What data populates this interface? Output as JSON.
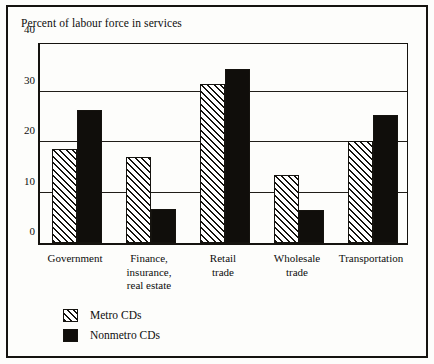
{
  "chart_data": {
    "type": "bar",
    "title": "Percent of labour force in services",
    "xlabel": "",
    "ylabel": "",
    "ylim": [
      0,
      40
    ],
    "yticks": [
      0,
      10,
      20,
      30,
      40
    ],
    "grid": true,
    "legend_position": "below-plot-left",
    "categories": [
      "Government",
      "Finance,\ninsurance,\nreal estate",
      "Retail\ntrade",
      "Wholesale\ntrade",
      "Transportation"
    ],
    "series": [
      {
        "name": "Metro CDs",
        "values": [
          18.6,
          17.0,
          31.4,
          13.4,
          20.2
        ]
      },
      {
        "name": "Nonmetro CDs",
        "values": [
          26.4,
          6.8,
          34.4,
          6.6,
          25.4
        ]
      }
    ]
  },
  "legend": {
    "items": [
      {
        "label": "Metro CDs",
        "swatch": "hatched-swatch"
      },
      {
        "label": "Nonmetro CDs",
        "swatch": "solid-black-swatch"
      }
    ]
  },
  "colors": {
    "ink": "#15130f",
    "page": "#fdfdfb",
    "metro_fill": "#ffffff",
    "nonmetro_fill": "#100e0b"
  }
}
